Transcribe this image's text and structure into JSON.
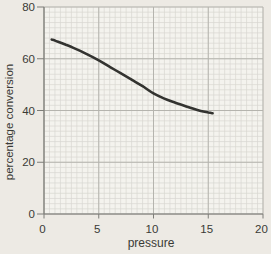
{
  "figure": {
    "kind": "line-chart-graph-paper"
  },
  "chart_data": {
    "type": "line",
    "title": "",
    "xlabel": "pressure",
    "ylabel": "percentage conversion",
    "xlim": [
      0,
      20
    ],
    "ylim": [
      0,
      80
    ],
    "x_ticks": [
      0,
      5,
      10,
      15,
      20
    ],
    "y_ticks": [
      0,
      20,
      40,
      60,
      80
    ],
    "x_minor_step": 0.5,
    "y_minor_step": 2,
    "grid": "fine graph-paper minor grid, darker major gridlines at labeled ticks",
    "legend": "none",
    "series": [
      {
        "name": "percentage conversion vs pressure",
        "points": [
          [
            0.7,
            67.4
          ],
          [
            1,
            67
          ],
          [
            2,
            65.4
          ],
          [
            3,
            63.6
          ],
          [
            4,
            61.6
          ],
          [
            5,
            59.4
          ],
          [
            6,
            56.9
          ],
          [
            7,
            54.4
          ],
          [
            8,
            51.9
          ],
          [
            9,
            49.4
          ],
          [
            10,
            46.6
          ],
          [
            11,
            44.6
          ],
          [
            12,
            43.0
          ],
          [
            13,
            41.6
          ],
          [
            14,
            40.2
          ],
          [
            15,
            39.2
          ],
          [
            15.4,
            38.9
          ]
        ]
      }
    ],
    "colors": {
      "line": "#333330",
      "grid_minor": "#d8d7d1",
      "grid_major": "#b5b4ae",
      "axis": "#7d7d78",
      "text": "#3a3a36",
      "plot_background": "#f4f3ee",
      "page_background": "#edeae4"
    }
  }
}
